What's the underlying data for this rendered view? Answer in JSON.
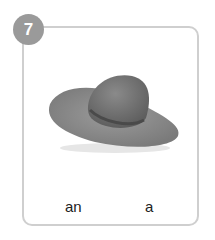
{
  "card": {
    "number": "7",
    "image": "hat",
    "options": [
      "an",
      "a"
    ]
  }
}
